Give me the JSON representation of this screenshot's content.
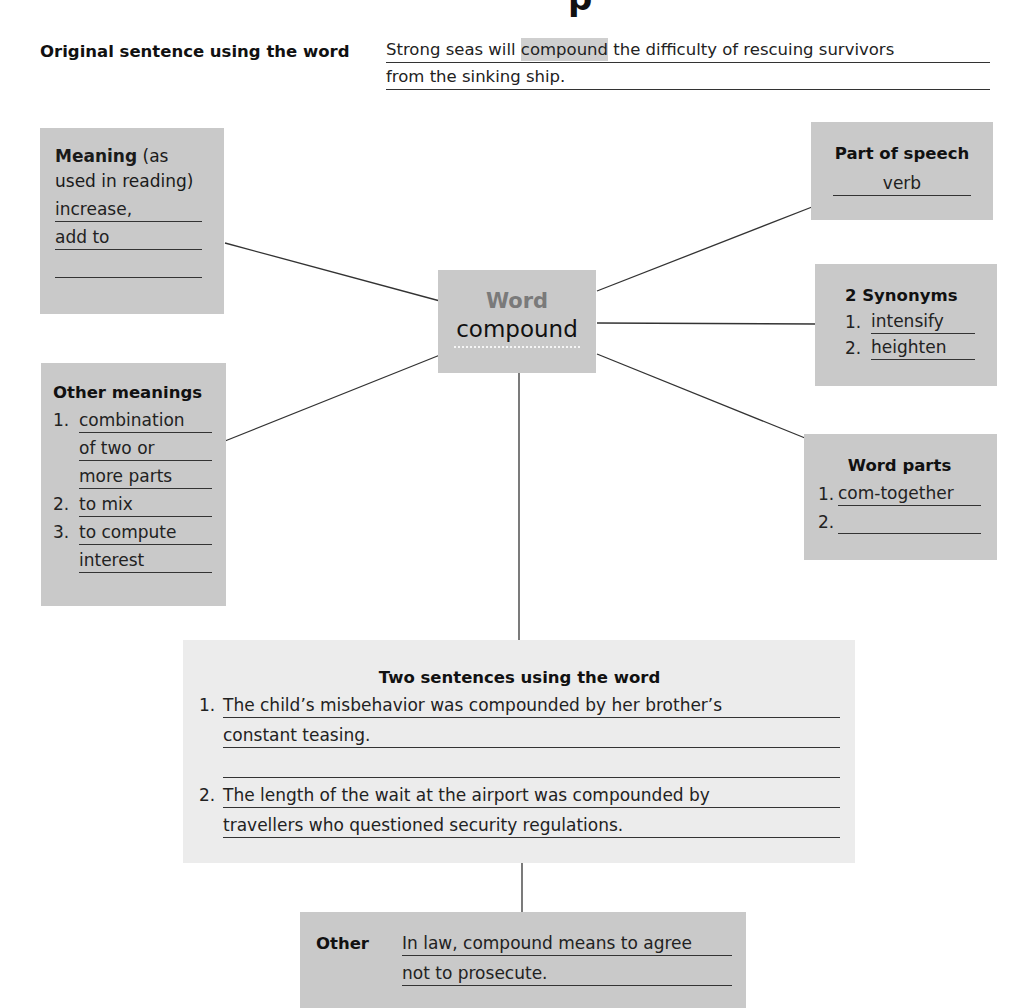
{
  "page": {
    "title_fragment": "p"
  },
  "original_sentence": {
    "label": "Original sentence using the word",
    "line1_before": "Strong seas will ",
    "line1_highlight": "compound",
    "line1_after": " the difficulty of rescuing survivors",
    "line2": "from the sinking ship."
  },
  "center": {
    "label": "Word",
    "word": "compound"
  },
  "meaning": {
    "label_bold": "Meaning",
    "label_rest": " (as used in reading)",
    "lines": [
      "increase,",
      "add to",
      ""
    ]
  },
  "other_meanings": {
    "label": "Other meanings",
    "items": [
      {
        "num": "1.",
        "lines": [
          "combination",
          "of two or",
          "more parts"
        ]
      },
      {
        "num": "2.",
        "lines": [
          "to mix"
        ]
      },
      {
        "num": "3.",
        "lines": [
          "to compute",
          "interest"
        ]
      }
    ]
  },
  "part_of_speech": {
    "label": "Part of speech",
    "value": "verb"
  },
  "synonyms": {
    "label": "2 Synonyms",
    "items": [
      {
        "num": "1.",
        "value": "intensify"
      },
      {
        "num": "2.",
        "value": "heighten"
      }
    ]
  },
  "word_parts": {
    "label": "Word parts",
    "items": [
      {
        "num": "1.",
        "value": "com-together"
      },
      {
        "num": "2.",
        "value": ""
      }
    ]
  },
  "two_sentences": {
    "label": "Two sentences using the word",
    "items": [
      {
        "num": "1.",
        "lines": [
          "The child’s misbehavior was compounded by her brother’s",
          "constant teasing.",
          ""
        ]
      },
      {
        "num": "2.",
        "lines": [
          "The length of the wait at the airport was compounded by",
          "travellers who questioned security regulations."
        ]
      }
    ]
  },
  "other": {
    "label": "Other",
    "lines": [
      "In law, compound means to agree",
      "not to prosecute."
    ]
  },
  "colors": {
    "box_gray": "#c9c9c9",
    "box_light": "#ececec",
    "center_label": "#7a7a7a",
    "line": "#333333"
  }
}
